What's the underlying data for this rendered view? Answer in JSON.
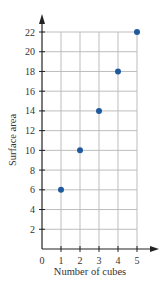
{
  "chart_data": {
    "type": "scatter",
    "title": "",
    "xlabel": "Number of cubes",
    "ylabel": "Surface area",
    "x": [
      1,
      2,
      3,
      4,
      5
    ],
    "series": [
      {
        "name": "Surface area",
        "values": [
          6,
          10,
          14,
          18,
          22
        ],
        "color": "#1f5a9e"
      }
    ],
    "xlim": [
      0,
      5
    ],
    "ylim": [
      0,
      22
    ],
    "x_ticks": [
      0,
      1,
      2,
      3,
      4,
      5
    ],
    "y_ticks": [
      2,
      4,
      6,
      8,
      10,
      12,
      14,
      16,
      18,
      20,
      22
    ],
    "grid": true,
    "legend": null
  },
  "style": {
    "point_color": "#1f5a9e",
    "grid_color": "#bdbdbd",
    "axis_color": "#222222"
  }
}
